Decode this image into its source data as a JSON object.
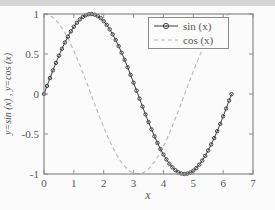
{
  "window": {
    "background": "#fbfbfb",
    "top_band_color": "#d6d6d6"
  },
  "chart_data": {
    "type": "line",
    "title": "",
    "xlabel": "x",
    "ylabel": "y=sin (x) , y=cos (x)",
    "xlim": [
      0,
      7
    ],
    "ylim": [
      -1,
      1
    ],
    "xticks": [
      0,
      1,
      2,
      3,
      4,
      5,
      6,
      7
    ],
    "yticks": [
      -1,
      -0.5,
      0,
      0.5,
      1
    ],
    "grid": false,
    "legend_position": "top-right",
    "axis_color": "#8a8a8a",
    "text_color": "#555555",
    "x": [
      0,
      0.1,
      0.2,
      0.3,
      0.4,
      0.5,
      0.6,
      0.7,
      0.8,
      0.9,
      1,
      1.1,
      1.2,
      1.3,
      1.4,
      1.5,
      1.6,
      1.7,
      1.8,
      1.9,
      2,
      2.1,
      2.2,
      2.3,
      2.4,
      2.5,
      2.6,
      2.7,
      2.8,
      2.9,
      3,
      3.1,
      3.2,
      3.3,
      3.4,
      3.5,
      3.6,
      3.7,
      3.8,
      3.9,
      4,
      4.1,
      4.2,
      4.3,
      4.4,
      4.5,
      4.6,
      4.7,
      4.8,
      4.9,
      5,
      5.1,
      5.2,
      5.3,
      5.4,
      5.5,
      5.6,
      5.7,
      5.8,
      5.9,
      6,
      6.1,
      6.2,
      6.28
    ],
    "series": [
      {
        "name": "sin (x)",
        "line_style": "solid",
        "marker": "circle",
        "color": "#3f3f3f",
        "values": [
          0,
          0.1,
          0.199,
          0.296,
          0.389,
          0.479,
          0.565,
          0.644,
          0.717,
          0.783,
          0.841,
          0.891,
          0.932,
          0.964,
          0.985,
          0.997,
          1,
          0.992,
          0.974,
          0.947,
          0.909,
          0.863,
          0.808,
          0.746,
          0.675,
          0.599,
          0.516,
          0.427,
          0.335,
          0.239,
          0.141,
          0.042,
          -0.058,
          -0.158,
          -0.256,
          -0.351,
          -0.443,
          -0.53,
          -0.612,
          -0.688,
          -0.757,
          -0.818,
          -0.872,
          -0.916,
          -0.952,
          -0.978,
          -0.994,
          -1,
          -0.996,
          -0.982,
          -0.959,
          -0.926,
          -0.883,
          -0.832,
          -0.773,
          -0.706,
          -0.631,
          -0.551,
          -0.465,
          -0.374,
          -0.279,
          -0.182,
          -0.083,
          -0.003
        ]
      },
      {
        "name": "cos (x)",
        "line_style": "dashed",
        "marker": "none",
        "color": "#b5b5b5",
        "values": [
          1,
          0.995,
          0.98,
          0.955,
          0.921,
          0.878,
          0.825,
          0.765,
          0.697,
          0.622,
          0.54,
          0.454,
          0.362,
          0.267,
          0.17,
          0.071,
          -0.029,
          -0.129,
          -0.227,
          -0.323,
          -0.416,
          -0.505,
          -0.589,
          -0.666,
          -0.737,
          -0.801,
          -0.857,
          -0.904,
          -0.942,
          -0.971,
          -0.99,
          -0.999,
          -0.998,
          -0.987,
          -0.967,
          -0.936,
          -0.896,
          -0.848,
          -0.791,
          -0.726,
          -0.654,
          -0.575,
          -0.49,
          -0.401,
          -0.307,
          -0.211,
          -0.112,
          -0.012,
          0.087,
          0.187,
          0.284,
          0.378,
          0.469,
          0.554,
          0.635,
          0.709,
          0.776,
          0.835,
          0.886,
          0.927,
          0.96,
          0.983,
          0.997,
          1
        ]
      }
    ]
  }
}
